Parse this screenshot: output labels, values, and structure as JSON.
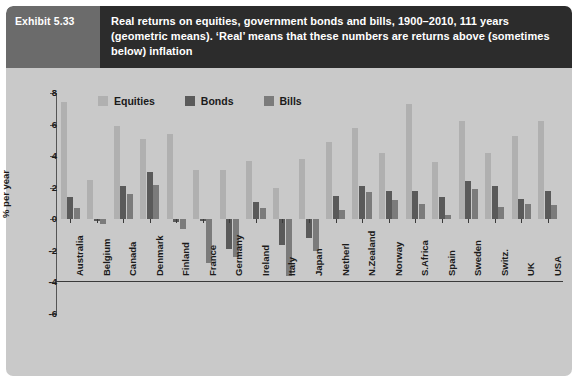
{
  "header": {
    "exhibit_label": "Exhibit 5.33",
    "title": "Real returns on equities, government bonds and bills, 1900–2010, 111 years (geometric means). ‘Real’ means that these numbers are returns above (sometimes below) inflation"
  },
  "legend": {
    "position": "top-left-inside",
    "items": [
      {
        "label": "Equities",
        "color": "#b0b0b0"
      },
      {
        "label": "Bonds",
        "color": "#5a5a5a"
      },
      {
        "label": "Bills",
        "color": "#7b7b7b"
      }
    ]
  },
  "axes": {
    "ylabel": "% per year",
    "yticks": [
      8,
      6,
      4,
      2,
      0,
      -2,
      -4,
      -6
    ],
    "ylim": [
      -6,
      8
    ],
    "grid": false
  },
  "colors": {
    "panel_background": "#c9c9c9",
    "header_dark": "#2c2c2c",
    "header_tab": "#6b6b6b",
    "axis": "#3a3a3a",
    "equities": "#b0b0b0",
    "bonds": "#5a5a5a",
    "bills": "#7b7b7b"
  },
  "chart_data": {
    "type": "bar",
    "title": "Real returns on equities, government bonds and bills, 1900–2010, 111 years",
    "xlabel": "",
    "ylabel": "% per year",
    "ylim": [
      -6,
      8
    ],
    "yticks": [
      8,
      6,
      4,
      2,
      0,
      -2,
      -4,
      -6
    ],
    "grid": false,
    "legend_position": "top-left-inside",
    "categories": [
      "Australia",
      "Belgium",
      "Canada",
      "Denmark",
      "Finland",
      "France",
      "Germany",
      "Ireland",
      "Italy",
      "Japan",
      "Netherl",
      "N.Zealand",
      "Norway",
      "S.Africa",
      "Spain",
      "Sweden",
      "Switz.",
      "UK",
      "USA"
    ],
    "series": [
      {
        "name": "Equities",
        "color": "#b0b0b0",
        "values": [
          7.4,
          2.5,
          5.9,
          5.1,
          5.4,
          3.1,
          3.1,
          3.7,
          2.0,
          3.8,
          4.9,
          5.8,
          4.2,
          7.3,
          3.6,
          6.2,
          4.2,
          5.3,
          6.2
        ]
      },
      {
        "name": "Bonds",
        "color": "#5a5a5a",
        "values": [
          1.4,
          -0.1,
          2.1,
          3.0,
          -0.2,
          -0.1,
          -1.9,
          1.1,
          -1.6,
          -1.2,
          1.5,
          2.1,
          1.8,
          1.8,
          1.4,
          2.4,
          2.1,
          1.3,
          1.8
        ]
      },
      {
        "name": "Bills",
        "color": "#7b7b7b",
        "values": [
          0.7,
          -0.3,
          1.6,
          2.2,
          -0.6,
          -2.8,
          -2.4,
          0.7,
          -3.6,
          -2.0,
          0.6,
          1.7,
          1.2,
          1.0,
          0.3,
          1.9,
          0.8,
          1.0,
          0.9
        ]
      }
    ]
  }
}
